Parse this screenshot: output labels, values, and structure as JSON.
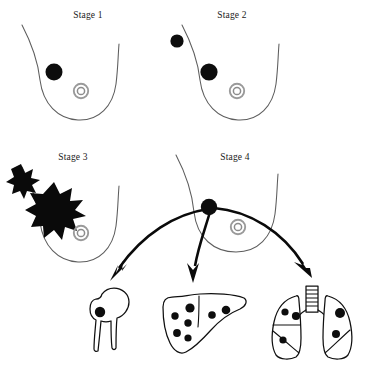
{
  "figure": {
    "background_color": "#ffffff",
    "width": 366,
    "height": 366
  },
  "palette": {
    "tumor": "#0d0d0d",
    "breast_outline": "#5d5d5d",
    "nipple": "#9a9a9a",
    "organ_outline": "#101010",
    "arrow": "#0a0a0a",
    "label_text": "#1a1a1a"
  },
  "panels": [
    {
      "id": "stage-1",
      "label": "Stage 1",
      "label_x": 88,
      "label_y": 18,
      "description": "Single small tumor confined within the breast",
      "tumors_inside": 1,
      "tumors_outside": 0,
      "has_nipple": true,
      "has_starburst": false
    },
    {
      "id": "stage-2",
      "label": "Stage 2",
      "label_x": 232,
      "label_y": 18,
      "description": "Larger tumor within the breast plus spread to a nearby lymph node",
      "tumors_inside": 1,
      "tumors_outside": 1,
      "has_nipple": true,
      "has_starburst": false
    },
    {
      "id": "stage-3",
      "label": "Stage 3",
      "label_x": 73,
      "label_y": 160,
      "description": "Large irregular tumor invading breast tissue with extension beyond the breast",
      "tumors_inside": 0,
      "tumors_outside": 0,
      "has_nipple": true,
      "has_starburst": true,
      "starburst_count": 2
    },
    {
      "id": "stage-4",
      "label": "Stage 4",
      "label_x": 235,
      "label_y": 160,
      "description": "Metastatic disease spreading from the breast to distant organs",
      "tumors_inside": 0,
      "tumors_outside": 1,
      "has_nipple": true,
      "has_starburst": false,
      "metastasis_targets": [
        "bone",
        "liver",
        "lung"
      ]
    }
  ],
  "metastasis_organs": [
    {
      "id": "bone",
      "name": "bone",
      "display_name": "Femur / hip bone",
      "lesion_count": 1
    },
    {
      "id": "liver",
      "name": "liver",
      "display_name": "Liver",
      "lesion_count": 7
    },
    {
      "id": "lung",
      "name": "lung",
      "display_name": "Lungs",
      "lesion_count": 5
    }
  ],
  "arrows": [
    {
      "id": "arrow-to-bone",
      "from": "breast-tumor",
      "to": "bone"
    },
    {
      "id": "arrow-to-liver",
      "from": "breast-tumor",
      "to": "liver"
    },
    {
      "id": "arrow-to-lung",
      "from": "breast-tumor",
      "to": "lung"
    }
  ]
}
